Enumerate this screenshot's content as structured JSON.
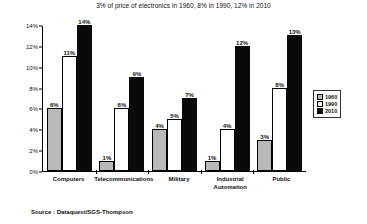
{
  "chart_data": {
    "type": "bar",
    "title": "3% of price of electronics in 1960, 8% in 1990, 12% in 2010",
    "xlabel": "",
    "ylabel": "",
    "ylim": [
      0,
      14
    ],
    "ytick_labels": [
      "0%",
      "2%",
      "4%",
      "6%",
      "8%",
      "10%",
      "12%",
      "14%"
    ],
    "ytick_values": [
      0,
      2,
      4,
      6,
      8,
      10,
      12,
      14
    ],
    "grid": false,
    "legend_position": "right",
    "value_suffix": "%",
    "categories": [
      "Computers",
      "Telecommunications",
      "Military",
      "Industrial Automation",
      "Public"
    ],
    "category_lines": [
      [
        "Computers"
      ],
      [
        "Telecommunications"
      ],
      [
        "Military"
      ],
      [
        "Industrial",
        "Automation"
      ],
      [
        "Public"
      ]
    ],
    "series": [
      {
        "name": "1960",
        "color": "#b9b9b9",
        "values": [
          6,
          1,
          4,
          1,
          3
        ],
        "labels": [
          "6%",
          "1%",
          "4%",
          "1%",
          "3%"
        ]
      },
      {
        "name": "1990",
        "color": "#ffffff",
        "values": [
          11,
          6,
          5,
          4,
          8
        ],
        "labels": [
          "11%",
          "6%",
          "5%",
          "4%",
          "8%"
        ]
      },
      {
        "name": "2010",
        "color": "#0a0a0a",
        "values": [
          14,
          9,
          7,
          12,
          13
        ],
        "labels": [
          "14%",
          "9%",
          "7%",
          "12%",
          "13%"
        ]
      }
    ]
  },
  "source": {
    "text": "Source : Dataquest/SGS-Thompson"
  }
}
